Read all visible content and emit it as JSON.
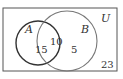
{
  "diagram": {
    "type": "venn",
    "universe_label": "U",
    "sets": [
      {
        "name": "A",
        "label": "A"
      },
      {
        "name": "B",
        "label": "B"
      }
    ],
    "regions": {
      "a_only": "15",
      "a_and_b": "10",
      "b_only": "5",
      "outside": "23"
    },
    "colors": {
      "circle_a": "#333333",
      "circle_b": "#666666",
      "border": "#444444"
    }
  }
}
